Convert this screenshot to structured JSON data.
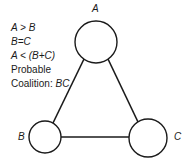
{
  "conditions": {
    "line1": "A > B",
    "line2": "B=C",
    "line3": "A < (B+C)",
    "line4": "Probable",
    "line5_prefix": "Coalition: ",
    "line5_value": "BC"
  },
  "nodes": [
    {
      "id": "A",
      "label": "A",
      "cx": 96,
      "cy": 42,
      "r": 21
    },
    {
      "id": "B",
      "label": "B",
      "cx": 45,
      "cy": 137,
      "r": 16
    },
    {
      "id": "C",
      "label": "C",
      "cx": 148,
      "cy": 138,
      "r": 19
    }
  ],
  "edges": [
    {
      "from": "A",
      "to": "B"
    },
    {
      "from": "A",
      "to": "C"
    },
    {
      "from": "B",
      "to": "C"
    }
  ],
  "colors": {
    "stroke": "#1a1a1a",
    "background": "#ffffff"
  }
}
